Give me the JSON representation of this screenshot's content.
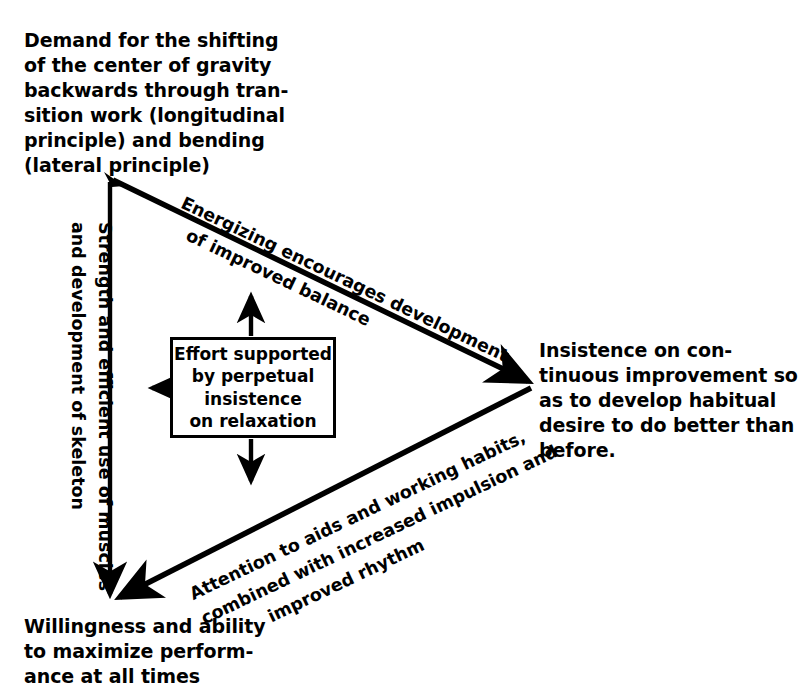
{
  "diagram": {
    "ink_color": "#000000",
    "background_color": "#ffffff",
    "vertices": [
      {
        "id": "top",
        "position": "top-left",
        "text": "Demand for the shifting\nof the center of gravity\nbackwards through tran-\nsition work (longitudinal\nprinciple) and bending\n(lateral principle)"
      },
      {
        "id": "right",
        "position": "middle-right",
        "text": "Insistence on con-\ntinuous improvement so\nas to develop habitual\ndesire to do better than\nbefore."
      },
      {
        "id": "bottom",
        "position": "bottom-left",
        "text": "Willingness and ability\nto maximize perform-\nance at all times"
      }
    ],
    "edges": [
      {
        "id": "top-to-right",
        "from": "top",
        "to": "right",
        "text": "Energizing encourages development\n   of improved balance"
      },
      {
        "id": "right-to-bottom",
        "from": "right",
        "to": "bottom",
        "text": "Attention to aids and working habits,\ncombined with increased impulsion and\n          improved rhythm"
      },
      {
        "id": "top-to-bottom",
        "from": "top",
        "to": "bottom",
        "text": "Strength and efficient use of muscles\nand development of skeleton"
      }
    ],
    "center": {
      "text": "Effort supported\nby perpetual\ninsistence\non relaxation",
      "arrows": [
        "up",
        "left",
        "down"
      ]
    }
  }
}
